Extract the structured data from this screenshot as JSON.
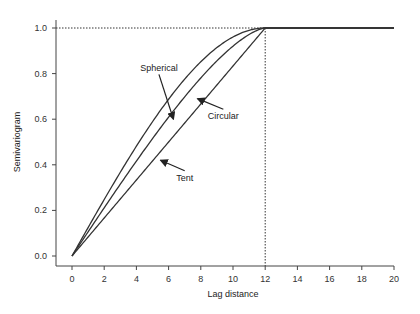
{
  "chart_data": {
    "type": "line",
    "title": "",
    "xlabel": "Lag distance",
    "ylabel": "Semivariogram",
    "xlim": [
      0,
      20
    ],
    "ylim": [
      0.0,
      1.0
    ],
    "xticks": [
      0,
      2,
      4,
      6,
      8,
      10,
      12,
      14,
      16,
      18,
      20
    ],
    "yticks": [
      0.0,
      0.2,
      0.4,
      0.6,
      0.8,
      1.0
    ],
    "xtick_labels": [
      "0",
      "2",
      "4",
      "6",
      "8",
      "10",
      "12",
      "14",
      "16",
      "18",
      "20"
    ],
    "ytick_labels": [
      "0.0",
      "0.2",
      "0.4",
      "0.6",
      "0.8",
      "1.0"
    ],
    "grid": false,
    "legend": null,
    "range": 12,
    "sill": 1.0,
    "reference_lines": [
      {
        "orientation": "horizontal",
        "y": 1.0,
        "style": "dotted",
        "from_x": 0,
        "to_x": 12
      },
      {
        "orientation": "vertical",
        "x": 12,
        "style": "dotted",
        "from_y": 0.0,
        "to_y": 1.0
      }
    ],
    "series": [
      {
        "name": "Spherical",
        "x": [
          0,
          1,
          2,
          3,
          4,
          5,
          6,
          7,
          8,
          9,
          10,
          11,
          12,
          20
        ],
        "values": [
          0.0,
          0.125,
          0.245,
          0.359,
          0.463,
          0.557,
          0.638,
          0.712,
          0.778,
          0.834,
          0.88,
          0.917,
          1.0,
          1.0
        ]
      },
      {
        "name": "Circular",
        "x": [
          0,
          1,
          2,
          3,
          4,
          5,
          6,
          7,
          8,
          9,
          10,
          11,
          12,
          20
        ],
        "values": [
          0.0,
          0.106,
          0.212,
          0.316,
          0.418,
          0.517,
          0.609,
          0.696,
          0.776,
          0.847,
          0.908,
          0.96,
          1.0,
          1.0
        ]
      },
      {
        "name": "Tent",
        "x": [
          0,
          12,
          20
        ],
        "values": [
          0.0,
          1.0,
          1.0
        ]
      }
    ],
    "annotations": [
      {
        "text": "Spherical",
        "label_x": 5.4,
        "label_y": 0.81,
        "arrow_to_x": 6.3,
        "arrow_to_y": 0.6
      },
      {
        "text": "Circular",
        "label_x": 9.4,
        "label_y": 0.6,
        "arrow_to_x": 7.8,
        "arrow_to_y": 0.69
      },
      {
        "text": "Tent",
        "label_x": 7.0,
        "label_y": 0.33,
        "arrow_to_x": 5.5,
        "arrow_to_y": 0.42
      }
    ]
  }
}
